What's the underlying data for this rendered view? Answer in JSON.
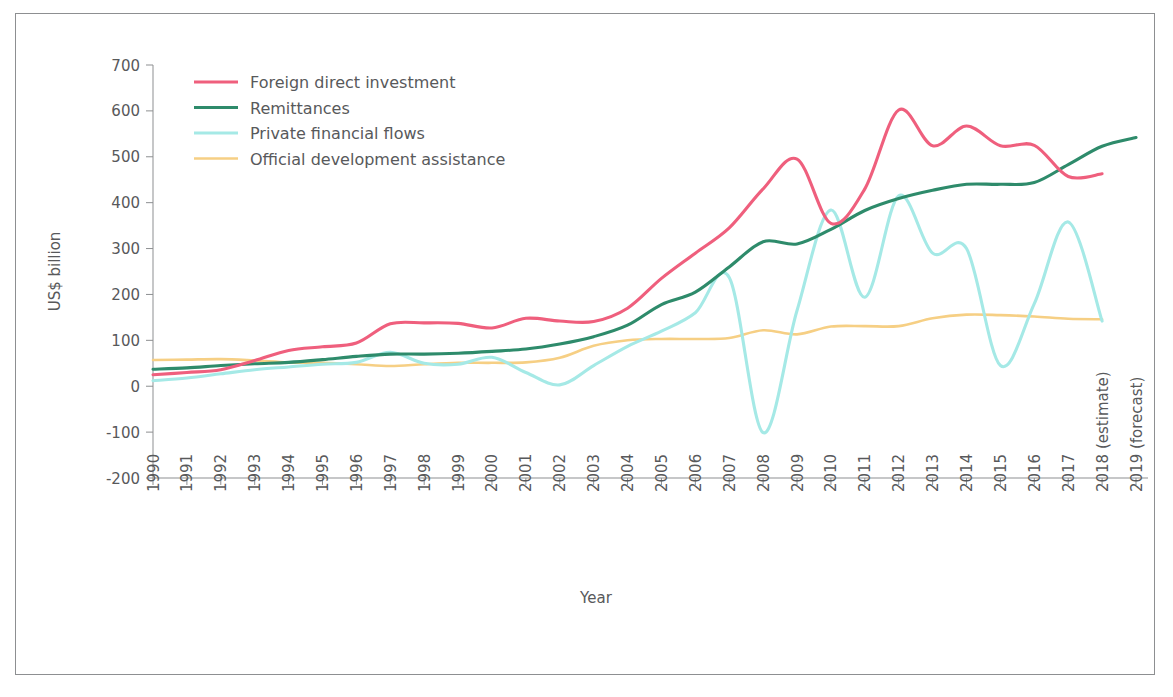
{
  "figure": {
    "frame": true,
    "background": "#ffffff"
  },
  "chart_data": {
    "type": "line",
    "title": "",
    "xlabel": "Year",
    "ylabel": "US$ billion",
    "grid": false,
    "legend_position": "top-left",
    "ylim": [
      -200,
      700
    ],
    "yticks": [
      -200,
      -100,
      0,
      100,
      200,
      300,
      400,
      500,
      600,
      700
    ],
    "ytick_labels": [
      "-200",
      "-100",
      "0",
      "100",
      "200",
      "300",
      "400",
      "500",
      "600",
      "700"
    ],
    "x": [
      1990,
      1991,
      1992,
      1993,
      1994,
      1995,
      1996,
      1997,
      1998,
      1999,
      2000,
      2001,
      2002,
      2003,
      2004,
      2005,
      2006,
      2007,
      2008,
      2009,
      2010,
      2011,
      2012,
      2013,
      2014,
      2015,
      2016,
      2017,
      2018,
      2019
    ],
    "xtick_labels": [
      "1990",
      "1991",
      "1992",
      "1993",
      "1994",
      "1995",
      "1996",
      "1997",
      "1998",
      "1999",
      "2000",
      "2001",
      "2002",
      "2003",
      "2004",
      "2005",
      "2006",
      "2007",
      "2008",
      "2009",
      "2010",
      "2011",
      "2012",
      "2013",
      "2014",
      "2015",
      "2016",
      "2017",
      "2018 (estimate)",
      "2019 (forecast)"
    ],
    "series": [
      {
        "name": "Foreign direct investment",
        "color": "#ef5f7d",
        "width": 3.1,
        "values": [
          25,
          30,
          36,
          56,
          78,
          86,
          94,
          136,
          138,
          137,
          127,
          148,
          142,
          141,
          170,
          235,
          290,
          345,
          430,
          495,
          355,
          430,
          602,
          524,
          567,
          524,
          525,
          457,
          463,
          null
        ]
      },
      {
        "name": "Remittances",
        "color": "#2e8b6b",
        "width": 3.1,
        "values": [
          37,
          40,
          45,
          49,
          52,
          58,
          65,
          70,
          70,
          72,
          76,
          81,
          92,
          108,
          133,
          178,
          205,
          260,
          315,
          310,
          342,
          383,
          409,
          427,
          440,
          440,
          444,
          483,
          523,
          542
        ]
      },
      {
        "name": "Private financial flows",
        "color": "#a5e9e6",
        "width": 3.1,
        "values": [
          12,
          18,
          27,
          36,
          42,
          48,
          52,
          74,
          50,
          48,
          63,
          30,
          3,
          45,
          87,
          120,
          160,
          237,
          -101,
          165,
          384,
          194,
          415,
          290,
          300,
          45,
          180,
          358,
          142,
          null
        ]
      },
      {
        "name": "Official development assistance",
        "color": "#f6cf84",
        "width": 2.6,
        "values": [
          57,
          58,
          59,
          56,
          52,
          51,
          48,
          44,
          48,
          51,
          51,
          52,
          62,
          88,
          100,
          103,
          103,
          105,
          122,
          113,
          130,
          131,
          131,
          148,
          156,
          155,
          152,
          147,
          146,
          null
        ]
      }
    ]
  }
}
